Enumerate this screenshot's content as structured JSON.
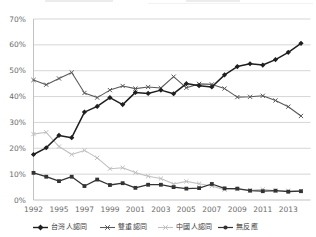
{
  "chart_data": {
    "type": "line",
    "title": "",
    "x": [
      1992,
      1994,
      1995,
      1996,
      1997,
      1998,
      1999,
      2000,
      2001,
      2002,
      2003,
      2004,
      2005,
      2006,
      2007,
      2008,
      2009,
      2010,
      2011,
      2012,
      2013,
      2014
    ],
    "x_tick_labels": [
      "1992",
      "1995",
      "1997",
      "1999",
      "2001",
      "2003",
      "2005",
      "2007",
      "2009",
      "2011",
      "2013"
    ],
    "y_tick_labels": [
      "0%",
      "10%",
      "20%",
      "30%",
      "40%",
      "50%",
      "60%",
      "70%"
    ],
    "ylim": [
      0,
      70
    ],
    "y_tick_step": 10,
    "grid": true,
    "legend_position": "bottom",
    "series": [
      {
        "name": "台灣人認同",
        "marker": "diamond",
        "color": "#1f1f1f",
        "line_width": 1.5,
        "values": [
          17.6,
          20.2,
          25.0,
          24.1,
          34.0,
          36.2,
          39.6,
          36.9,
          41.6,
          41.2,
          42.5,
          41.1,
          45.0,
          44.2,
          43.7,
          48.4,
          51.6,
          52.7,
          52.2,
          54.3,
          57.1,
          60.6
        ]
      },
      {
        "name": "雙重認同",
        "marker": "x",
        "color": "#5a5a5a",
        "line_width": 1.1,
        "values": [
          46.4,
          44.6,
          47.0,
          49.3,
          41.4,
          39.6,
          42.5,
          44.1,
          43.1,
          43.7,
          43.3,
          47.7,
          43.4,
          44.9,
          44.7,
          43.1,
          39.8,
          39.9,
          40.3,
          38.5,
          36.1,
          32.5
        ]
      },
      {
        "name": "中國人認同",
        "marker": "x",
        "color": "#c0c0c0",
        "line_width": 1.1,
        "values": [
          25.5,
          26.2,
          20.7,
          17.6,
          19.2,
          16.3,
          12.1,
          12.5,
          10.6,
          9.2,
          8.3,
          6.2,
          7.2,
          6.3,
          5.4,
          4.0,
          4.2,
          3.8,
          4.1,
          3.6,
          3.6,
          3.5
        ]
      },
      {
        "name": "無反應",
        "marker": "square",
        "color": "#333333",
        "line_width": 1.3,
        "values": [
          10.5,
          9.0,
          7.3,
          9.0,
          5.4,
          7.9,
          5.8,
          6.5,
          4.7,
          5.9,
          5.9,
          5.0,
          4.4,
          4.6,
          6.2,
          4.5,
          4.4,
          3.6,
          3.4,
          3.6,
          3.2,
          3.4
        ]
      }
    ]
  },
  "colors": {
    "background": "#ffffff",
    "gridline": "#d6d6d6",
    "axis_line": "#c2c2c2",
    "tick_label": "#6b6b6b",
    "legend_text": "#3d3d3d"
  }
}
